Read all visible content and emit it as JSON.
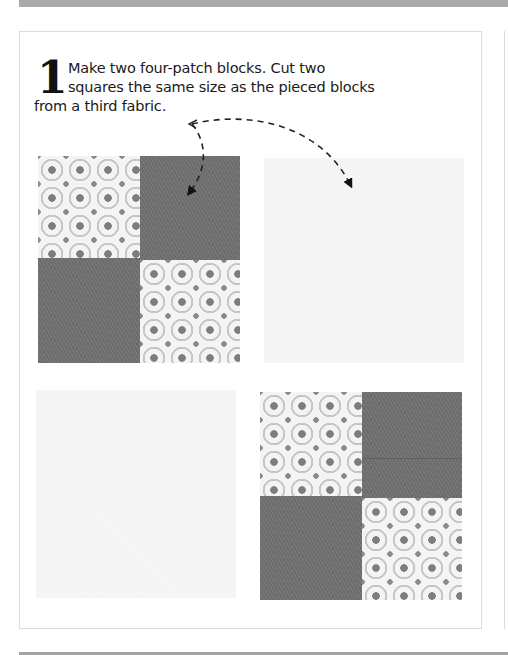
{
  "page": {
    "step": {
      "number": "1",
      "lines": [
        "Make two four-patch blocks. Cut two",
        "squares the same size as the pieced blocks",
        "from a third fabric."
      ]
    },
    "illustration": {
      "blocks": [
        {
          "name": "four-patch-block-top-left",
          "type": "four-patch",
          "layout": [
            "print",
            "solid",
            "solid",
            "print"
          ]
        },
        {
          "name": "plain-square-top-right",
          "type": "plain-square"
        },
        {
          "name": "plain-square-bottom-left",
          "type": "plain-square"
        },
        {
          "name": "four-patch-block-bottom-right",
          "type": "four-patch",
          "layout": [
            "print",
            "solid",
            "solid",
            "print"
          ]
        }
      ],
      "arrows": [
        {
          "name": "arrow-to-four-patch",
          "from": "step-text-end",
          "to": "four-patch-block-top-left"
        },
        {
          "name": "arrow-to-plain-square",
          "from": "step-text-end",
          "to": "plain-square-top-right"
        }
      ]
    },
    "colors": {
      "solid_fabric": "#727272",
      "print_background": "#f4f4f4",
      "plain_fabric": "#f6f6f6",
      "panel_border": "#dcdcdc",
      "page_bar": "#a9a9a9",
      "text": "#1a1a1a"
    }
  }
}
